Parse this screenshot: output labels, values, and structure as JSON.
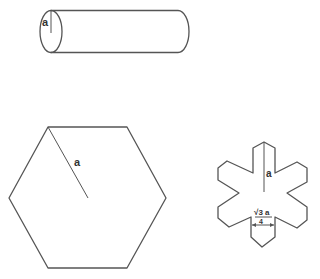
{
  "diagram": {
    "colors": {
      "stroke": "#555555",
      "text": "#333333",
      "background": "#ffffff"
    },
    "shapes": [
      {
        "id": "cylinder",
        "type": "cylinder",
        "label": "a",
        "description": "Horizontal cylinder with radius a marked on the circular end face"
      },
      {
        "id": "hexagon",
        "type": "regular-hexagon",
        "label": "a",
        "description": "Regular hexagon with circumradius a drawn from a vertex to the center"
      },
      {
        "id": "star",
        "type": "six-armed-star",
        "label": "a",
        "dimension": {
          "numerator": "√3 a",
          "denominator": "4"
        },
        "description": "Six-armed star-shaped cross section with arm length a and arm width √3a/4"
      }
    ]
  }
}
